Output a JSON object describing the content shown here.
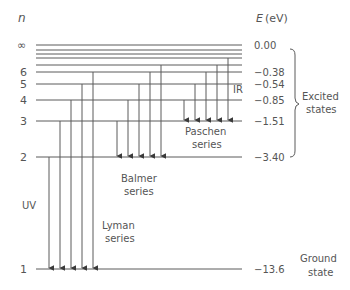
{
  "axes": {
    "n_label": "n",
    "e_label": "E",
    "e_unit": "(eV)"
  },
  "levels": [
    {
      "n": "1",
      "energy": "−13.6",
      "y": 269
    },
    {
      "n": "2",
      "energy": "−3.40",
      "y": 157
    },
    {
      "n": "3",
      "energy": "−1.51",
      "y": 121
    },
    {
      "n": "4",
      "energy": "−0.85",
      "y": 100
    },
    {
      "n": "5",
      "energy": "−0.54",
      "y": 84
    },
    {
      "n": "6",
      "energy": "−0.38",
      "y": 72
    },
    {
      "n": "∞",
      "energy": "0.00",
      "y": 45
    }
  ],
  "extra_level_lines_y": [
    50,
    54,
    58,
    65
  ],
  "series": [
    {
      "name": "lyman",
      "label_line1": "Lyman",
      "label_line2": "series",
      "region": "UV",
      "target_y": 269,
      "x": [
        49,
        60,
        71,
        82,
        93
      ],
      "from_y": [
        157,
        121,
        100,
        84,
        72
      ]
    },
    {
      "name": "balmer",
      "label_line1": "Balmer",
      "label_line2": "series",
      "target_y": 157,
      "x": [
        117,
        128,
        139,
        150,
        161
      ],
      "from_y": [
        121,
        100,
        84,
        72,
        65
      ]
    },
    {
      "name": "paschen",
      "label_line1": "Paschen",
      "label_line2": "series",
      "region": "IR",
      "target_y": 121,
      "x": [
        184,
        195,
        206,
        217,
        228
      ],
      "from_y": [
        100,
        84,
        72,
        65,
        58
      ]
    }
  ],
  "annotations": {
    "uv": "UV",
    "ir": "IR",
    "excited_line1": "Excited",
    "excited_line2": "states",
    "ground_line1": "Ground",
    "ground_line2": "state"
  },
  "colors": {
    "line": "#5a5a5a",
    "text": "#555555"
  }
}
